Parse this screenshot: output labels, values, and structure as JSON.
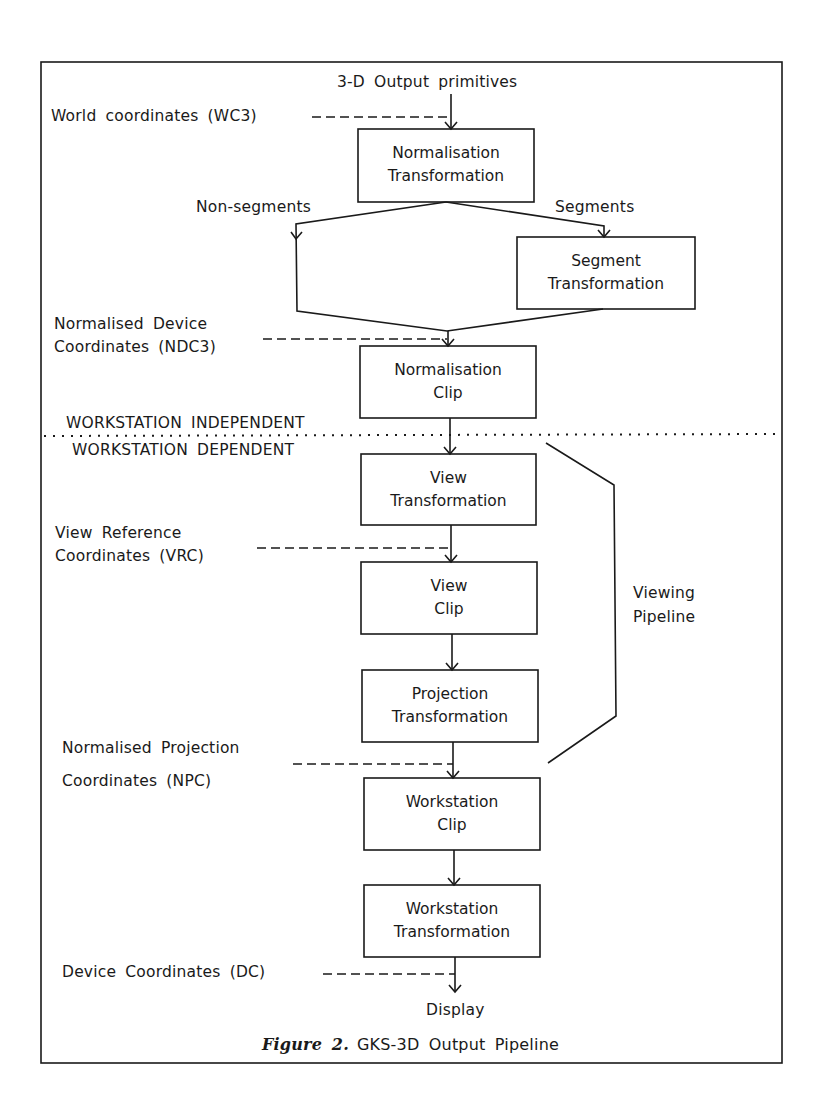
{
  "diagram": {
    "input_label": "3-D Output primitives",
    "coordinate_labels": {
      "wc3": "World coordinates (WC3)",
      "ndc3_line1": "Normalised Device",
      "ndc3_line2": "Coordinates (NDC3)",
      "vrc_line1": "View Reference",
      "vrc_line2": "Coordinates (VRC)",
      "npc_line1": "Normalised Projection",
      "npc_line2": "Coordinates (NPC)",
      "dc": "Device Coordinates (DC)"
    },
    "branch_labels": {
      "non_segments": "Non-segments",
      "segments": "Segments"
    },
    "boxes": [
      {
        "line1": "Normalisation",
        "line2": "Transformation"
      },
      {
        "line1": "Segment",
        "line2": "Transformation"
      },
      {
        "line1": "Normalisation",
        "line2": "Clip"
      },
      {
        "line1": "View",
        "line2": "Transformation"
      },
      {
        "line1": "View",
        "line2": "Clip"
      },
      {
        "line1": "Projection",
        "line2": "Transformation"
      },
      {
        "line1": "Workstation",
        "line2": "Clip"
      },
      {
        "line1": "Workstation",
        "line2": "Transformation"
      }
    ],
    "divider": {
      "above": "WORKSTATION INDEPENDENT",
      "below": "WORKSTATION DEPENDENT"
    },
    "bracket_label_line1": "Viewing",
    "bracket_label_line2": "Pipeline",
    "output_label": "Display"
  },
  "caption": {
    "figure": "Figure 2.",
    "text": "GKS-3D Output Pipeline"
  }
}
